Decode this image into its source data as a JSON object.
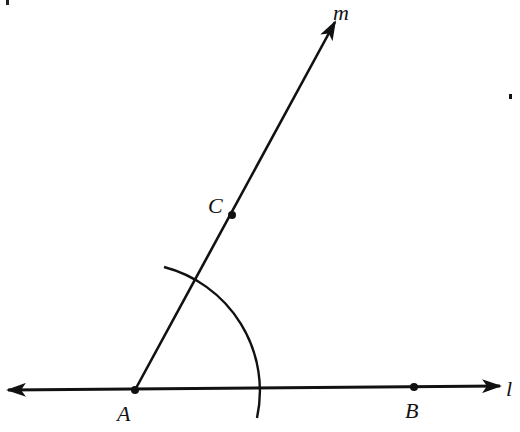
{
  "diagram": {
    "type": "geometric-construction",
    "colors": {
      "ink": "#111111",
      "background": "#ffffff"
    },
    "points": [
      {
        "id": "A",
        "label": "A",
        "x": 135,
        "y": 390
      },
      {
        "id": "B",
        "label": "B",
        "x": 414,
        "y": 387
      },
      {
        "id": "C",
        "label": "C",
        "x": 232,
        "y": 215
      }
    ],
    "lines": [
      {
        "id": "l",
        "label": "l",
        "kind": "line",
        "through": [
          "A",
          "B"
        ]
      },
      {
        "id": "m",
        "label": "m",
        "kind": "ray",
        "from": "A",
        "through": "C"
      }
    ],
    "arcs": [
      {
        "center": "A",
        "radius": 125,
        "description": "compass arc crossing ray m and line l"
      }
    ],
    "labels": {
      "point_A": "A",
      "point_B": "B",
      "point_C": "C",
      "line_l": "l",
      "ray_m": "m"
    }
  }
}
